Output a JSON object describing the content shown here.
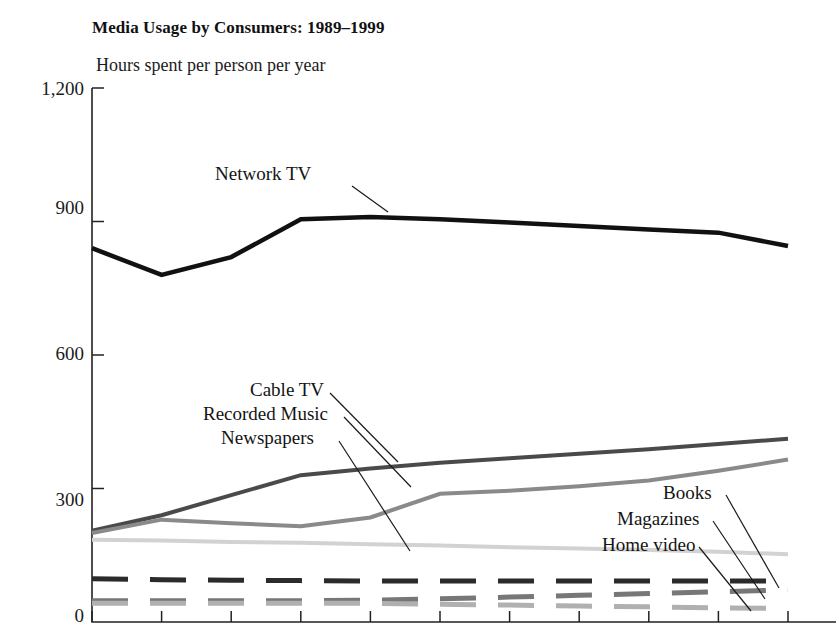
{
  "chart_data": {
    "type": "line",
    "title": "Media Usage by Consumers: 1989–1999",
    "subtitle": "Hours spent per person per year",
    "xlabel": "",
    "ylabel": "Hours spent per person per year",
    "ylim": [
      0,
      1200
    ],
    "yticks": [
      0,
      300,
      600,
      900,
      1200
    ],
    "ytick_labels": [
      "0",
      "300",
      "600",
      "900",
      "1,200"
    ],
    "grid": false,
    "legend_position": "inline-labels",
    "x": [
      1989,
      1990,
      1991,
      1992,
      1993,
      1994,
      1995,
      1996,
      1997,
      1998,
      1999
    ],
    "xtick_labels": [
      "",
      "",
      "",
      "",
      "",
      "",
      "",
      "",
      "",
      "",
      ""
    ],
    "series": [
      {
        "name": "Network TV",
        "color": "#111111",
        "style": "solid",
        "width": 4.5,
        "values": [
          840,
          780,
          820,
          905,
          910,
          905,
          898,
          890,
          882,
          875,
          845
        ]
      },
      {
        "name": "Cable TV",
        "color": "#4a4a4a",
        "style": "solid",
        "width": 4.0,
        "values": [
          205,
          240,
          285,
          330,
          345,
          358,
          368,
          378,
          388,
          400,
          412
        ]
      },
      {
        "name": "Recorded Music",
        "color": "#8a8a8a",
        "style": "solid",
        "width": 4.0,
        "values": [
          200,
          230,
          222,
          215,
          235,
          288,
          295,
          305,
          318,
          340,
          365
        ]
      },
      {
        "name": "Newspapers",
        "color": "#d2d2d2",
        "style": "solid",
        "width": 4.0,
        "values": [
          185,
          183,
          180,
          178,
          175,
          172,
          168,
          165,
          162,
          158,
          152
        ]
      },
      {
        "name": "Books",
        "color": "#2b2b2b",
        "style": "dashed",
        "width": 5.0,
        "values": [
          97,
          95,
          94,
          93,
          92,
          92,
          92,
          92,
          92,
          92,
          92
        ]
      },
      {
        "name": "Magazines",
        "color": "#777777",
        "style": "dashed",
        "width": 5.0,
        "values": [
          48,
          48,
          48,
          48,
          49,
          52,
          56,
          60,
          64,
          68,
          72
        ]
      },
      {
        "name": "Home video",
        "color": "#b0b0b0",
        "style": "dashed",
        "width": 5.0,
        "values": [
          42,
          42,
          42,
          42,
          42,
          40,
          38,
          36,
          34,
          32,
          30
        ]
      }
    ],
    "annotations": [
      {
        "text": "Network TV",
        "x": 215,
        "y": 163,
        "leader": [
          [
            352,
            186
          ],
          [
            388,
            212
          ]
        ]
      },
      {
        "text": "Cable TV",
        "x": 250,
        "y": 379,
        "leader": [
          [
            330,
            393
          ],
          [
            398,
            462
          ]
        ]
      },
      {
        "text": "Recorded Music",
        "x": 203,
        "y": 403,
        "leader": [
          [
            344,
            417
          ],
          [
            411,
            487
          ]
        ]
      },
      {
        "text": "Newspapers",
        "x": 221,
        "y": 427,
        "leader": [
          [
            339,
            441
          ],
          [
            410,
            551
          ]
        ]
      },
      {
        "text": "Books",
        "x": 663,
        "y": 482,
        "leader": [
          [
            726,
            495
          ],
          [
            779,
            588
          ]
        ]
      },
      {
        "text": "Magazines",
        "x": 617,
        "y": 508,
        "leader": [
          [
            713,
            521
          ],
          [
            765,
            599
          ]
        ]
      },
      {
        "text": "Home video",
        "x": 602,
        "y": 534,
        "leader": [
          [
            699,
            547
          ],
          [
            751,
            611
          ]
        ]
      }
    ]
  },
  "axes": {
    "yticks": [
      {
        "label": "1,200",
        "top": 78,
        "right": 84
      },
      {
        "label": "900",
        "top": 197,
        "right": 84
      },
      {
        "label": "600",
        "top": 343,
        "right": 84
      },
      {
        "label": "300",
        "top": 489,
        "right": 84
      },
      {
        "label": "0",
        "top": 605,
        "right": 84
      }
    ]
  }
}
